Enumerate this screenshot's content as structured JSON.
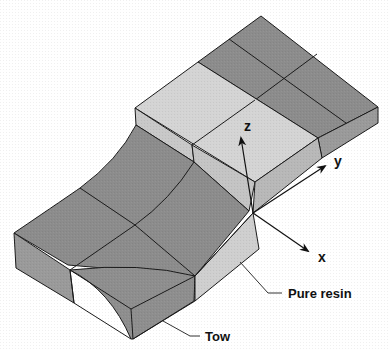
{
  "figure": {
    "type": "3D schematic of a woven composite unit cell",
    "axes": {
      "x_label": "x",
      "y_label": "y",
      "z_label": "z"
    },
    "annotations": {
      "pure_resin": "Pure resin",
      "tow": "Tow"
    },
    "colors": {
      "tow_face": "#8c8c8c",
      "tow_side": "#9a9a9a",
      "resin_face": "#d4d4d4",
      "resin_side": "#c2c2c2",
      "edge": "#1a1a1a",
      "background": "#ffffff"
    }
  }
}
